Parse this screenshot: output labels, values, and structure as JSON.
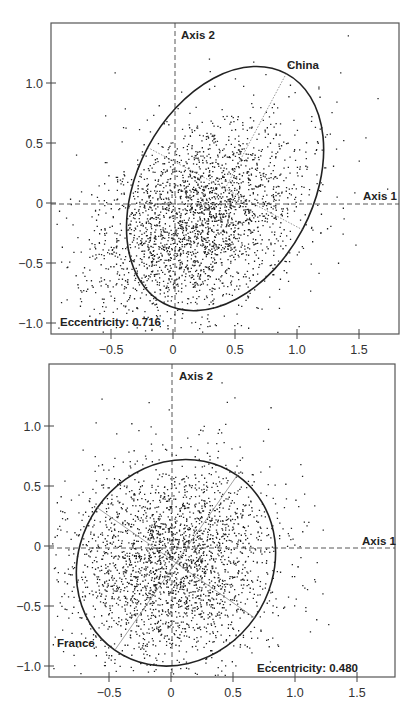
{
  "chart_data": [
    {
      "type": "scatter",
      "title": "",
      "xlabel": "Axis 1",
      "ylabel": "Axis 2",
      "xlim": [
        -0.95,
        1.83
      ],
      "ylim": [
        -1.1,
        1.5
      ],
      "x_ticks": [
        -0.5,
        0,
        0.5,
        1.0,
        1.5
      ],
      "x_tick_labels": [
        "-0.5",
        "0",
        "0.5",
        "1.0",
        "1.5"
      ],
      "y_ticks": [
        -1.0,
        -0.5,
        0,
        0.5,
        1.0
      ],
      "y_tick_labels": [
        "-1.0",
        "-0.5",
        "0",
        "0.5",
        "1.0"
      ],
      "grid": false,
      "reference_lines": "dashed lines at x=0 and y=0",
      "annotations": {
        "ellipse_label": "China",
        "eccentricity_text": "Eccentricity: 0.716",
        "eccentricity": 0.716
      },
      "ellipse": {
        "center": [
          0.42,
          0.12
        ],
        "semi_major": 1.05,
        "semi_minor": 0.73,
        "angle_deg": 62
      },
      "point_cloud": {
        "n": 2600,
        "center": [
          0.2,
          -0.15
        ],
        "sd_x": 0.42,
        "sd_y": 0.42,
        "corr": 0.35,
        "seed": 11
      }
    },
    {
      "type": "scatter",
      "title": "",
      "xlabel": "Axis 1",
      "ylabel": "Axis 2",
      "xlim": [
        -0.98,
        1.83
      ],
      "ylim": [
        -1.1,
        1.5
      ],
      "x_ticks": [
        -0.5,
        0,
        0.5,
        1.0,
        1.5
      ],
      "x_tick_labels": [
        "-0.5",
        "0",
        "0.5",
        "1.0",
        "1.5"
      ],
      "y_ticks": [
        -1.0,
        -0.5,
        0,
        0.5,
        1.0
      ],
      "y_tick_labels": [
        "-1.0",
        "-0.5",
        "0",
        "0.5",
        "1.0"
      ],
      "grid": false,
      "reference_lines": "dashed lines at x=0 and y=0",
      "annotations": {
        "ellipse_label": "France",
        "eccentricity_text": "Eccentricity: 0.480",
        "eccentricity": 0.48
      },
      "ellipse": {
        "center": [
          0.04,
          -0.14
        ],
        "semi_major": 0.86,
        "semi_minor": 0.8,
        "angle_deg": 55
      },
      "point_cloud": {
        "n": 2600,
        "center": [
          0.0,
          -0.15
        ],
        "sd_x": 0.42,
        "sd_y": 0.42,
        "corr": 0.05,
        "seed": 23
      }
    }
  ],
  "plots": [
    {
      "axis1_label": "Axis 1",
      "axis2_label": "Axis 2",
      "ellipse_label": "China",
      "eccentricity_text": "Eccentricity: 0.716"
    },
    {
      "axis1_label": "Axis 1",
      "axis2_label": "Axis 2",
      "ellipse_label": "France",
      "eccentricity_text": "Eccentricity: 0.480"
    }
  ]
}
